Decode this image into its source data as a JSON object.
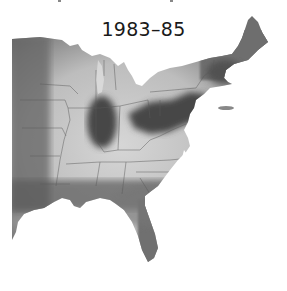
{
  "title": "1983–85",
  "map": {
    "region": "Eastern United States",
    "style": "grayscale density map",
    "colors": {
      "high": "#4a4a4a",
      "mid": "#8a8a8a",
      "low": "#cfcfcf",
      "edge": "#6a6a6a",
      "borders": "#555555",
      "water": "#ffffff"
    }
  }
}
